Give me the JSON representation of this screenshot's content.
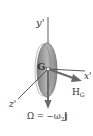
{
  "diagram": {
    "labels": {
      "y_axis": "y'",
      "x_axis": "x'",
      "z_axis": "z'",
      "center": "G",
      "angular_momentum": "H",
      "angular_momentum_sub": "G",
      "omega_eq": "Ω = −ω",
      "omega_sub": "2",
      "omega_unit": "j"
    },
    "colors": {
      "disk_fill": "#9a9a9a",
      "disk_edge": "#6e6e6e",
      "axis_line": "#333333",
      "vector": "#6a6a6a",
      "text": "#333333"
    }
  }
}
